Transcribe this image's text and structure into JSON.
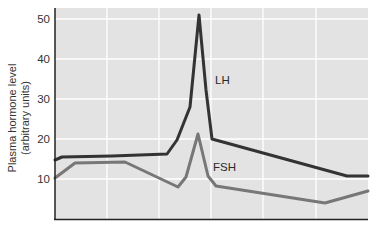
{
  "chart_data": {
    "type": "line",
    "title": "",
    "xlabel": "",
    "ylabel": "Plasma hormone level (arbitrary units)",
    "ylabel_lines": [
      "Plasma hormone level",
      "(arbitrary units)"
    ],
    "ylim": [
      0,
      52
    ],
    "yticks": [
      10,
      20,
      30,
      40,
      50
    ],
    "xticks": [],
    "grid": true,
    "legend": "inline labels",
    "series": [
      {
        "name": "LH",
        "color": "#333333",
        "label_pos": {
          "x": 215,
          "y": 84
        },
        "points": [
          [
            0,
            14.75
          ],
          [
            7,
            15.5
          ],
          [
            57,
            15.75
          ],
          [
            112,
            16.25
          ],
          [
            122,
            19.75
          ],
          [
            135,
            28
          ],
          [
            144,
            51
          ],
          [
            151,
            32.25
          ],
          [
            157,
            20
          ],
          [
            292,
            10.75
          ],
          [
            313,
            10.75
          ]
        ]
      },
      {
        "name": "FSH",
        "color": "#777777",
        "label_pos": {
          "x": 213,
          "y": 171
        },
        "points": [
          [
            0,
            10.25
          ],
          [
            20,
            14
          ],
          [
            70,
            14.25
          ],
          [
            123,
            8
          ],
          [
            131,
            10.5
          ],
          [
            143,
            21.25
          ],
          [
            153,
            10.75
          ],
          [
            161,
            8.25
          ],
          [
            270,
            4
          ],
          [
            313,
            7
          ]
        ]
      }
    ]
  },
  "colors": {
    "plot_bg": "#e3e3e3",
    "grid": "#ffffff",
    "axis": "#222222"
  }
}
